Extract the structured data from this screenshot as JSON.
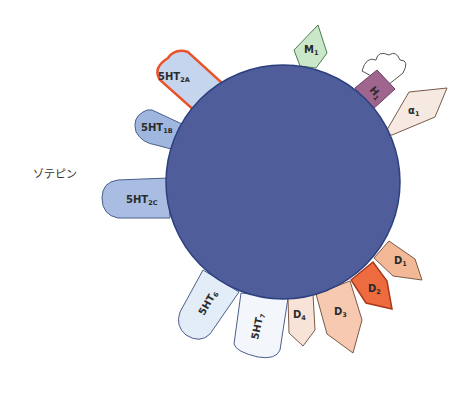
{
  "drug": {
    "name": "ゾテピン"
  },
  "colors": {
    "core": "#4f5d9a",
    "core_stroke": "#2c3f7f",
    "ht_fill_dark": "#9fb6de",
    "ht_fill_light": "#e3edf8",
    "ht_stroke": "#4a5f8c",
    "ht2a_stroke": "#e8532a",
    "m1_fill": "#c9e7c9",
    "h1_fill": "#a0658f",
    "a1_fill": "#f5e9e2",
    "d_fill": "#f3b896",
    "d_light": "#f8e3d8",
    "d2_fill": "#ee6a3f"
  },
  "receptors": [
    {
      "id": "5ht2a",
      "main": "5HT",
      "sub": "2A"
    },
    {
      "id": "5ht1b",
      "main": "5HT",
      "sub": "1B"
    },
    {
      "id": "5ht2c",
      "main": "5HT",
      "sub": "2C"
    },
    {
      "id": "5ht6",
      "main": "5HT",
      "sub": "6"
    },
    {
      "id": "5ht7",
      "main": "5HT",
      "sub": "7"
    },
    {
      "id": "d4",
      "main": "D",
      "sub": "4"
    },
    {
      "id": "d3",
      "main": "D",
      "sub": "3"
    },
    {
      "id": "d2",
      "main": "D",
      "sub": "2"
    },
    {
      "id": "d1",
      "main": "D",
      "sub": "1"
    },
    {
      "id": "alpha1",
      "main": "α",
      "sub": "1"
    },
    {
      "id": "h1",
      "main": "H",
      "sub": "1"
    },
    {
      "id": "m1",
      "main": "M",
      "sub": "1"
    }
  ]
}
